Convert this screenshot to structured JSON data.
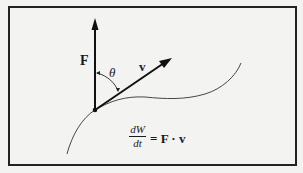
{
  "diagram": {
    "labels": {
      "force": "F",
      "velocity": "v",
      "angle": "θ"
    },
    "equation": {
      "numerator": "dW",
      "denominator": "dt",
      "rhs": "= F · v"
    },
    "colors": {
      "background": "#f3f3f1",
      "ink": "#1a1a1a",
      "frame": "#222222"
    }
  }
}
